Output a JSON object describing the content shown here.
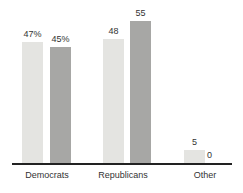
{
  "chart_data": {
    "type": "bar",
    "categories": [
      "Democrats",
      "Republicans",
      "Other"
    ],
    "series": [
      {
        "name": "series-1-light",
        "color": "#e4e4e1",
        "values": [
          47,
          48,
          5
        ],
        "value_labels": [
          "47%",
          "48",
          "5"
        ]
      },
      {
        "name": "series-2-dark",
        "color": "#a7a7a5",
        "values": [
          45,
          55,
          0
        ],
        "value_labels": [
          "45%",
          "55",
          "0"
        ]
      }
    ],
    "title": "",
    "xlabel": "",
    "ylabel": "",
    "ylim": [
      0,
      60
    ],
    "grid": false,
    "legend": "none",
    "value_labels_shown": true,
    "axis_line_color": "#222222",
    "background_color": "#ffffff"
  }
}
